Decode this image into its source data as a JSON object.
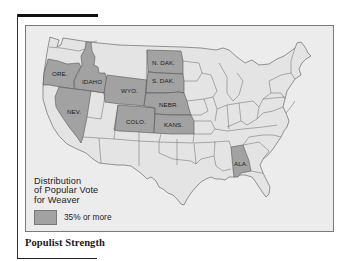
{
  "figure": {
    "caption": "Populist Strength",
    "legend": {
      "title_lines": [
        "Distribution",
        "of Popular Vote",
        "for Weaver"
      ],
      "entries": [
        {
          "label": "35% or more",
          "color": "#a2a2a2"
        }
      ]
    },
    "colors": {
      "highlight": "#a2a2a2",
      "base_state": "#e4e4e4",
      "water": "#ececec",
      "border": "#555555"
    },
    "highlighted_states": [
      {
        "label": "ORE."
      },
      {
        "label": "IDAHO"
      },
      {
        "label": "NEV."
      },
      {
        "label": "WYO."
      },
      {
        "label": "COLO."
      },
      {
        "label": "N. DAK."
      },
      {
        "label": "S. DAK."
      },
      {
        "label": "NEBR."
      },
      {
        "label": "KANS."
      },
      {
        "label": "ALA."
      }
    ]
  }
}
